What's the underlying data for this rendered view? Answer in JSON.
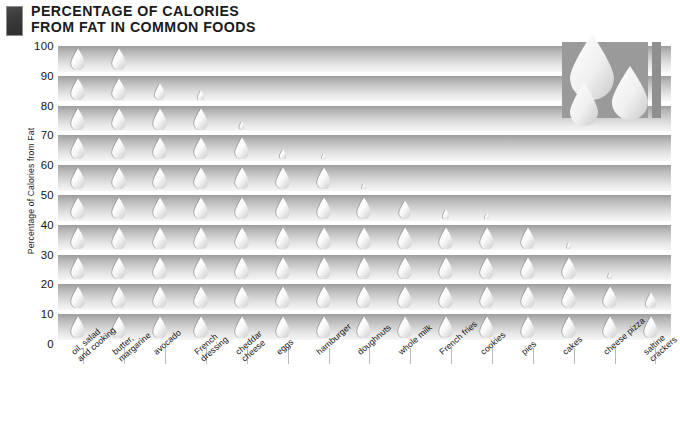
{
  "title": {
    "line1": "PERCENTAGE OF CALORIES",
    "line2": "FROM FAT IN COMMON FOODS",
    "full": "PERCENTAGE OF CALORIES FROM FAT IN COMMON FOODS",
    "icon": "dark-rectangle-icon"
  },
  "decoration": {
    "name": "water-droplets-graphic",
    "droplet_count": 3,
    "bar_color": "#9a9a9a",
    "droplet_color": "#f2f2f2"
  },
  "colors": {
    "band_dark": "#9d9d9d",
    "band_light": "#f6f6f6",
    "droplet": "#f4f4f4",
    "text": "#141414",
    "title": "#1a1a1a"
  },
  "chart_data": {
    "type": "bar",
    "subtitle": "",
    "xlabel": "",
    "ylabel": "Percentage of Calories from Fat",
    "ylim": [
      0,
      100
    ],
    "yticks": [
      100,
      90,
      80,
      70,
      60,
      50,
      40,
      30,
      20,
      10,
      0
    ],
    "ytick_labels": [
      "100",
      "90",
      "80",
      "70",
      "60",
      "50",
      "40",
      "30",
      "20",
      "10",
      "0"
    ],
    "grid": false,
    "legend": "none",
    "glyph": "droplet",
    "glyph_step": 10,
    "categories": [
      "oil, salad\nand cooking",
      "butter,\nmargarine",
      "avocado",
      "French\ndressing",
      "cheddar\ncheese",
      "eggs",
      "hamburger",
      "doughnuts",
      "whole milk",
      "French fries",
      "cookies",
      "pies",
      "cakes",
      "cheese pizza",
      "saltine\ncrackers"
    ],
    "categories_flat": [
      "oil, salad and cooking",
      "butter, margarine",
      "avocado",
      "French dressing",
      "cheddar cheese",
      "eggs",
      "hamburger",
      "doughnuts",
      "whole milk",
      "French fries",
      "cookies",
      "pies",
      "cakes",
      "cheese pizza",
      "saltine crackers"
    ],
    "values": [
      100,
      100,
      88,
      85,
      74,
      65,
      62,
      52,
      49,
      45,
      41,
      40,
      33,
      23,
      18
    ]
  }
}
